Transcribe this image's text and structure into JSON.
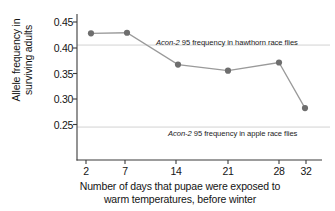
{
  "chart_data": {
    "type": "line",
    "title": "",
    "xlabel": "Number of days that pupae were exposed to warm temperatures, before winter",
    "xlabel_lines": [
      "Number of days that pupae were exposed to",
      "warm temperatures, before winter"
    ],
    "ylabel": "Allele frequency in surviving adults",
    "ylabel_lines": [
      "Allele frequency in",
      "surviving adults"
    ],
    "categories": [
      "2",
      "7",
      "14",
      "21",
      "28",
      "32"
    ],
    "x": [
      2,
      7,
      14,
      21,
      28,
      32
    ],
    "values": [
      0.428,
      0.429,
      0.367,
      0.355,
      0.371,
      0.282
    ],
    "series": [
      {
        "name": "Allele frequency in surviving adults",
        "values": [
          0.428,
          0.429,
          0.367,
          0.355,
          0.371,
          0.282
        ]
      }
    ],
    "yticks": [
      "0.45",
      "0.40",
      "0.35",
      "0.30",
      "0.25"
    ],
    "ytick_values": [
      0.45,
      0.4,
      0.35,
      0.3,
      0.25
    ],
    "xticks": [
      "2",
      "7",
      "14",
      "21",
      "28",
      "32"
    ],
    "ylim": [
      0.205,
      0.468
    ],
    "xlim": [
      0,
      34
    ],
    "grid": false,
    "legend": "none",
    "line_color": "#9a9a9a",
    "marker_color": "#6e6e6e",
    "axis_color": "#3b3b3b",
    "reference_line_color": "#d2d2d2",
    "reference_lines": [
      {
        "name": "hawthorn-reference-line",
        "value": 0.405,
        "label_prefix": "Acon-2",
        "label_suffix": " 95 frequency in hawthorn race flies",
        "label": "Acon-2 95 frequency in hawthorn race flies"
      },
      {
        "name": "apple-reference-line",
        "value": 0.245,
        "label_prefix": "Acon-2",
        "label_suffix": " 95 frequency in apple race flies",
        "label": "Acon-2 95 frequency in apple race flies"
      }
    ],
    "annotations": [
      "Acon-2 95 frequency in hawthorn race flies",
      "Acon-2 95 frequency in apple race flies"
    ]
  }
}
